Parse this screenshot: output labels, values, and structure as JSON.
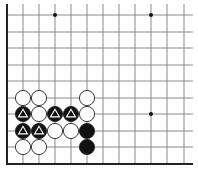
{
  "diagram": {
    "type": "go-board-fragment",
    "colors": {
      "background": "#ffffff",
      "grid": "#8a8a8a",
      "edge": "#222222",
      "black_stone": "#111111",
      "white_stone": "#ffffff",
      "stone_outline": "#222222",
      "triangle_mark": "#ffffff",
      "star_point": "#111111"
    },
    "grid": {
      "columns_x": [
        7,
        23,
        39,
        55,
        71,
        87,
        103,
        119,
        135,
        151,
        167,
        184
      ],
      "rows_y": [
        15,
        32,
        48,
        65,
        81,
        98,
        114,
        131,
        147,
        164
      ],
      "right_extent": 193,
      "top_extent": 4,
      "left_edge": true,
      "bottom_edge": true
    },
    "star_points": [
      {
        "x": 55,
        "y": 15
      },
      {
        "x": 151,
        "y": 15
      },
      {
        "x": 151,
        "y": 114
      }
    ],
    "stones": [
      {
        "color": "white",
        "x": 23,
        "y": 98,
        "mark": ""
      },
      {
        "color": "white",
        "x": 39,
        "y": 98,
        "mark": ""
      },
      {
        "color": "white",
        "x": 87,
        "y": 98,
        "mark": ""
      },
      {
        "color": "black",
        "x": 23,
        "y": 114,
        "mark": "triangle"
      },
      {
        "color": "white",
        "x": 39,
        "y": 114,
        "mark": ""
      },
      {
        "color": "black",
        "x": 55,
        "y": 114,
        "mark": "triangle"
      },
      {
        "color": "black",
        "x": 71,
        "y": 114,
        "mark": "triangle"
      },
      {
        "color": "white",
        "x": 87,
        "y": 114,
        "mark": ""
      },
      {
        "color": "black",
        "x": 23,
        "y": 131,
        "mark": "triangle"
      },
      {
        "color": "black",
        "x": 39,
        "y": 131,
        "mark": "triangle"
      },
      {
        "color": "white",
        "x": 55,
        "y": 131,
        "mark": ""
      },
      {
        "color": "white",
        "x": 71,
        "y": 131,
        "mark": ""
      },
      {
        "color": "black",
        "x": 87,
        "y": 131,
        "mark": ""
      },
      {
        "color": "white",
        "x": 23,
        "y": 147,
        "mark": ""
      },
      {
        "color": "white",
        "x": 39,
        "y": 147,
        "mark": ""
      },
      {
        "color": "black",
        "x": 87,
        "y": 147,
        "mark": ""
      }
    ],
    "stone_radius": 7.6
  }
}
